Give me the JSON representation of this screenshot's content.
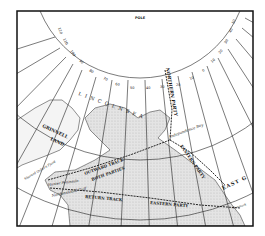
{
  "map": {
    "title_marker": "POLE",
    "colors": {
      "paper": "#ffffff",
      "ink": "#1a1a1a",
      "land": "#d9d9d9",
      "frame": "#111111"
    },
    "seas": [
      {
        "label": "L I N C O L N   S E A"
      }
    ],
    "regions": [
      {
        "label": "GRINNELL",
        "label2": "LAND"
      },
      {
        "label": "EAST G"
      }
    ],
    "places": [
      {
        "label": "Independence Bay"
      },
      {
        "label": "Sherard Osborn Fjord"
      },
      {
        "label": "Hunter Peninsula"
      },
      {
        "label": "Nordenskiold Gulf"
      },
      {
        "label": "Denmark"
      }
    ],
    "tracks": [
      {
        "label": "NORTHERN PARTY"
      },
      {
        "label": "OUTWARD TRACK"
      },
      {
        "label": "BOTH PARTIES"
      },
      {
        "label": "EASTERN PARTY"
      },
      {
        "label": "RETURN TRACK"
      },
      {
        "label": "EASTERN PARTY"
      }
    ],
    "meridian_labels": [
      "120",
      "110",
      "100",
      "90",
      "80",
      "70",
      "60",
      "50",
      "40",
      "30",
      "20",
      "10",
      "0",
      "10",
      "20",
      "30",
      "40",
      "50",
      "60"
    ]
  }
}
